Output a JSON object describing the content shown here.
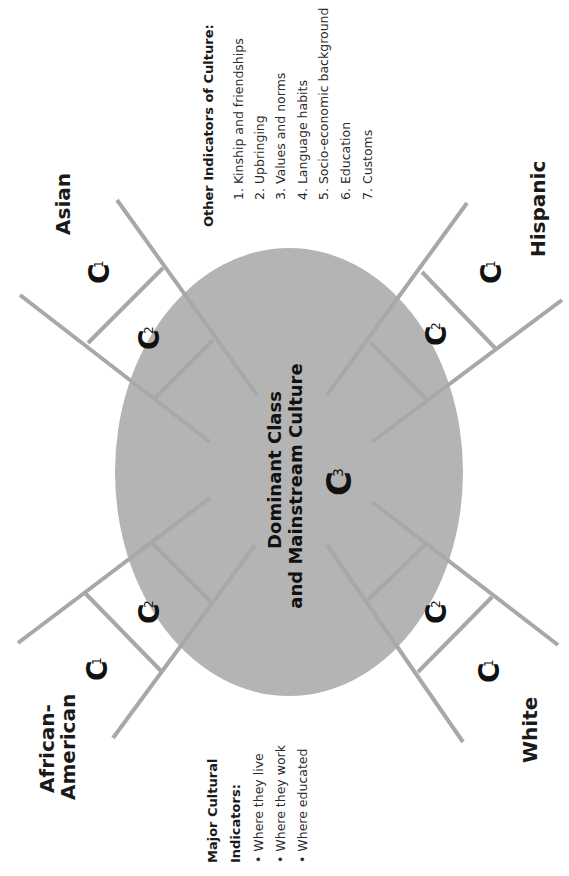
{
  "diagram": {
    "center": {
      "line1": "Dominant Class",
      "line2": "and Mainstream Culture",
      "label": "C",
      "subscript": "3",
      "fill_color": "#b4b4b4"
    },
    "line_color": "#a8a8a8",
    "groups": [
      {
        "id": "asian",
        "name": "Asian",
        "outer": {
          "label": "C",
          "sub": "1"
        },
        "inner": {
          "label": "C",
          "sub": "2"
        }
      },
      {
        "id": "hispanic",
        "name": "Hispanic",
        "outer": {
          "label": "C",
          "sub": "1"
        },
        "inner": {
          "label": "C",
          "sub": "2"
        }
      },
      {
        "id": "african-american",
        "name_line1": "African-",
        "name_line2": "American",
        "outer": {
          "label": "C",
          "sub": "1"
        },
        "inner": {
          "label": "C",
          "sub": "2"
        }
      },
      {
        "id": "white",
        "name": "White",
        "outer": {
          "label": "C",
          "sub": "1"
        },
        "inner": {
          "label": "C",
          "sub": "2"
        }
      }
    ]
  },
  "other_indicators": {
    "title": "Other Indicators of Culture:",
    "items": [
      "1. Kinship and friendships",
      "2. Upbringing",
      "3. Values and norms",
      "4. Language habits",
      "5. Socio-economic background",
      "6. Education",
      "7. Customs"
    ]
  },
  "major_indicators": {
    "title_line1": "Major Cultural",
    "title_line2": "Indicators:",
    "items": [
      "•  Where they live",
      "•  Where they work",
      "•  Where educated"
    ]
  }
}
